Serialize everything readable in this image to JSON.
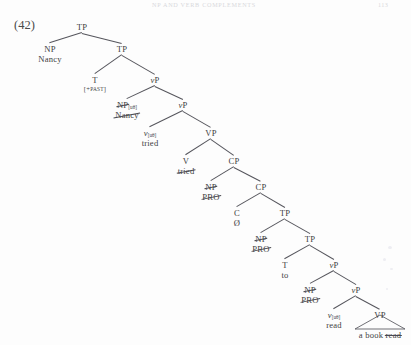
{
  "page": {
    "running_head": "NP AND VERB COMPLEMENTS",
    "page_number": "113",
    "example_number": "(42)"
  },
  "tree": {
    "type": "syntax-tree",
    "sentence": "Nancy tried to read a book",
    "nodes": [
      {
        "id": "TP1",
        "cat": "TP",
        "lex": "",
        "x": 82,
        "y": 22,
        "struck_cat": false,
        "struck_lex": false,
        "feature": ""
      },
      {
        "id": "NP1",
        "cat": "NP",
        "lex": "Nancy",
        "x": 50,
        "y": 44,
        "struck_cat": false,
        "struck_lex": false,
        "feature": ""
      },
      {
        "id": "TP2",
        "cat": "TP",
        "lex": "",
        "x": 122,
        "y": 44,
        "struck_cat": false,
        "struck_lex": false,
        "feature": ""
      },
      {
        "id": "T1",
        "cat": "T",
        "lex": "[+PAST]",
        "x": 95,
        "y": 75,
        "struck_cat": false,
        "struck_lex": false,
        "feature": ""
      },
      {
        "id": "vP1",
        "cat": "vP",
        "lex": "",
        "x": 155,
        "y": 75,
        "struck_cat": false,
        "struck_lex": false,
        "feature": ""
      },
      {
        "id": "NP2",
        "cat": "NP",
        "lex": "Nancy",
        "x": 127,
        "y": 100,
        "struck_cat": true,
        "struck_lex": true,
        "feature": "[uθ]"
      },
      {
        "id": "vP2",
        "cat": "vP",
        "lex": "",
        "x": 183,
        "y": 100,
        "struck_cat": false,
        "struck_lex": false,
        "feature": ""
      },
      {
        "id": "v1",
        "cat": "v",
        "lex": "tried",
        "x": 150,
        "y": 128,
        "struck_cat": false,
        "struck_lex": false,
        "feature": "[uθ]"
      },
      {
        "id": "VP1",
        "cat": "VP",
        "lex": "",
        "x": 211,
        "y": 128,
        "struck_cat": false,
        "struck_lex": false,
        "feature": ""
      },
      {
        "id": "V1",
        "cat": "V",
        "lex": "tried",
        "x": 186,
        "y": 156,
        "struck_cat": false,
        "struck_lex": true,
        "feature": ""
      },
      {
        "id": "CP1",
        "cat": "CP",
        "lex": "",
        "x": 234,
        "y": 156,
        "struck_cat": false,
        "struck_lex": false,
        "feature": ""
      },
      {
        "id": "NP3",
        "cat": "NP",
        "lex": "PRO",
        "x": 211,
        "y": 182,
        "struck_cat": true,
        "struck_lex": true,
        "feature": ""
      },
      {
        "id": "CPbar",
        "cat": "CP",
        "lex": "",
        "x": 261,
        "y": 182,
        "struck_cat": false,
        "struck_lex": false,
        "feature": ""
      },
      {
        "id": "C1",
        "cat": "C",
        "lex": "Ø",
        "x": 237,
        "y": 208,
        "struck_cat": false,
        "struck_lex": false,
        "feature": ""
      },
      {
        "id": "TP3",
        "cat": "TP",
        "lex": "",
        "x": 285,
        "y": 208,
        "struck_cat": false,
        "struck_lex": false,
        "feature": ""
      },
      {
        "id": "NP4",
        "cat": "NP",
        "lex": "PRO",
        "x": 261,
        "y": 234,
        "struck_cat": true,
        "struck_lex": true,
        "feature": ""
      },
      {
        "id": "TP4",
        "cat": "TP",
        "lex": "",
        "x": 310,
        "y": 234,
        "struck_cat": false,
        "struck_lex": false,
        "feature": ""
      },
      {
        "id": "T2",
        "cat": "T",
        "lex": "to",
        "x": 285,
        "y": 260,
        "struck_cat": false,
        "struck_lex": false,
        "feature": ""
      },
      {
        "id": "vP3",
        "cat": "vP",
        "lex": "",
        "x": 334,
        "y": 260,
        "struck_cat": false,
        "struck_lex": false,
        "feature": ""
      },
      {
        "id": "NP5",
        "cat": "NP",
        "lex": "PRO",
        "x": 310,
        "y": 285,
        "struck_cat": true,
        "struck_lex": true,
        "feature": ""
      },
      {
        "id": "vP4",
        "cat": "vP",
        "lex": "",
        "x": 356,
        "y": 285,
        "struck_cat": false,
        "struck_lex": false,
        "feature": ""
      },
      {
        "id": "v2",
        "cat": "v",
        "lex": "read",
        "x": 334,
        "y": 310,
        "struck_cat": false,
        "struck_lex": false,
        "feature": "[uθ]"
      },
      {
        "id": "VP2",
        "cat": "VP",
        "lex": "",
        "x": 380,
        "y": 310,
        "struck_cat": false,
        "struck_lex": false,
        "feature": ""
      }
    ],
    "edges": [
      {
        "from": "TP1",
        "to": "NP1"
      },
      {
        "from": "TP1",
        "to": "TP2"
      },
      {
        "from": "TP2",
        "to": "T1"
      },
      {
        "from": "TP2",
        "to": "vP1"
      },
      {
        "from": "vP1",
        "to": "NP2"
      },
      {
        "from": "vP1",
        "to": "vP2"
      },
      {
        "from": "vP2",
        "to": "v1"
      },
      {
        "from": "vP2",
        "to": "VP1"
      },
      {
        "from": "VP1",
        "to": "V1"
      },
      {
        "from": "VP1",
        "to": "CP1"
      },
      {
        "from": "CP1",
        "to": "NP3"
      },
      {
        "from": "CP1",
        "to": "CPbar"
      },
      {
        "from": "CPbar",
        "to": "C1"
      },
      {
        "from": "CPbar",
        "to": "TP3"
      },
      {
        "from": "TP3",
        "to": "NP4"
      },
      {
        "from": "TP3",
        "to": "TP4"
      },
      {
        "from": "TP4",
        "to": "T2"
      },
      {
        "from": "TP4",
        "to": "vP3"
      },
      {
        "from": "vP3",
        "to": "NP5"
      },
      {
        "from": "vP3",
        "to": "vP4"
      },
      {
        "from": "vP4",
        "to": "v2"
      },
      {
        "from": "vP4",
        "to": "VP2"
      }
    ],
    "triangles": [
      {
        "id": "TRI1",
        "parent": "VP2",
        "text_plain": "a book",
        "text_struck": "read",
        "apex_x": 380,
        "apex_y": 315,
        "half_width": 25,
        "depth": 14
      }
    ]
  }
}
